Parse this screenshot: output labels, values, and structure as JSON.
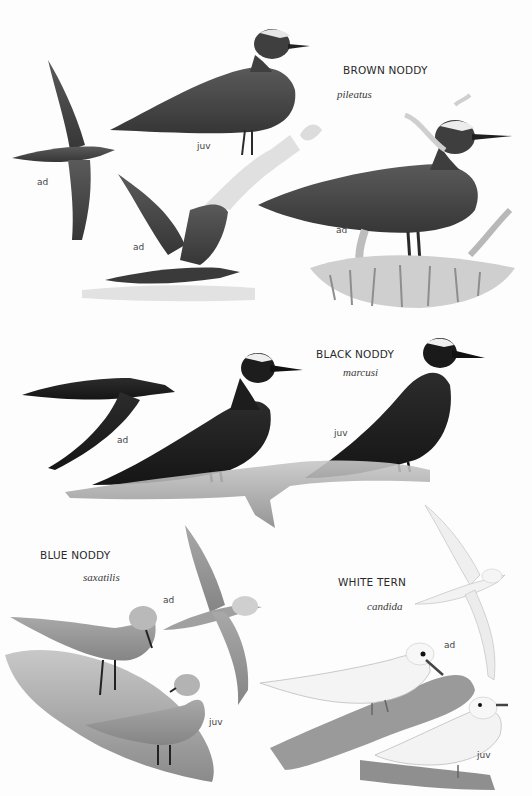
{
  "plate": {
    "background": "#fdfdfd",
    "species": [
      {
        "name": "BROWN NODDY",
        "latin": "pileatus",
        "labels": [
          {
            "text": "ad",
            "x": 37,
            "y": 178
          },
          {
            "text": "juv",
            "x": 197,
            "y": 143
          },
          {
            "text": "ad",
            "x": 133,
            "y": 243
          },
          {
            "text": "ad",
            "x": 336,
            "y": 226
          }
        ],
        "colors": {
          "body": "#4a4a4a",
          "cap": "#e8e8e8"
        }
      },
      {
        "name": "BLACK NODDY",
        "latin": "marcusi",
        "labels": [
          {
            "text": "ad",
            "x": 117,
            "y": 436
          },
          {
            "text": "juv",
            "x": 334,
            "y": 429
          }
        ],
        "colors": {
          "body": "#1e1e1e",
          "cap": "#efefef"
        }
      },
      {
        "name": "BLUE NODDY",
        "latin": "saxatilis",
        "labels": [
          {
            "text": "ad",
            "x": 163,
            "y": 596
          },
          {
            "text": "juv",
            "x": 209,
            "y": 718
          }
        ],
        "colors": {
          "body": "#9a9a9a",
          "cap": "#dcdcdc"
        }
      },
      {
        "name": "WHITE TERN",
        "latin": "candida",
        "labels": [
          {
            "text": "ad",
            "x": 444,
            "y": 641
          },
          {
            "text": "juv",
            "x": 477,
            "y": 751
          }
        ],
        "colors": {
          "body": "#f4f4f4",
          "outline": "#bdbdbd"
        }
      }
    ]
  }
}
